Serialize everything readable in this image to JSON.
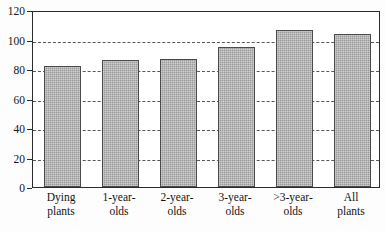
{
  "chart_data": {
    "type": "bar",
    "title": "",
    "subtitle": "",
    "xlabel": "",
    "ylabel": "",
    "categories": [
      "Dying plants",
      "1-year-olds",
      "2-year-olds",
      "3-year-olds",
      ">3-year-olds",
      "All plants"
    ],
    "category_lines": [
      [
        "Dying",
        "plants"
      ],
      [
        "1-year-",
        "olds"
      ],
      [
        "2-year-",
        "olds"
      ],
      [
        "3-year-",
        "olds"
      ],
      [
        ">3-year-",
        "olds"
      ],
      [
        "All",
        "plants"
      ]
    ],
    "values": [
      82,
      86,
      86.5,
      95,
      106.5,
      104
    ],
    "ylim": [
      0,
      120
    ],
    "yticks": [
      0,
      20,
      40,
      60,
      80,
      100,
      120
    ],
    "ytick_labels": [
      "0",
      "20",
      "40",
      "60",
      "80",
      "100",
      "120"
    ],
    "gridlines": [
      20,
      40,
      60,
      80,
      100
    ],
    "grid": true,
    "legend": null,
    "bar_color": "#9a9a9a",
    "bar_edge_color": "#4a4a4a",
    "frame_color": "#2b2b2b",
    "grid_color": "#3b3b3b"
  }
}
